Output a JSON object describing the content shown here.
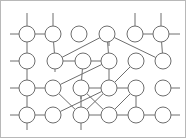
{
  "figure": {
    "type": "node-link-diagram",
    "width": 186,
    "height": 138,
    "background_color": "#ffffff",
    "stroke_color": "#6e6e6e",
    "node_fill_color": "#ffffff",
    "border_color": "#b8b8b8",
    "node_radius": 8,
    "node_count": 24,
    "grid_rows": 4,
    "grid_columns": 6
  },
  "nodes": [
    {
      "id": "n00",
      "row": 0,
      "col": 0,
      "cx": 27,
      "cy": 34
    },
    {
      "id": "n01",
      "row": 0,
      "col": 1,
      "cx": 53,
      "cy": 34
    },
    {
      "id": "n02",
      "row": 0,
      "col": 2,
      "cx": 79,
      "cy": 34
    },
    {
      "id": "n03",
      "row": 0,
      "col": 3,
      "cx": 107,
      "cy": 34
    },
    {
      "id": "n04",
      "row": 0,
      "col": 4,
      "cx": 135,
      "cy": 34
    },
    {
      "id": "n05",
      "row": 0,
      "col": 5,
      "cx": 161,
      "cy": 34
    },
    {
      "id": "n10",
      "row": 1,
      "col": 0,
      "cx": 27,
      "cy": 61
    },
    {
      "id": "n11",
      "row": 1,
      "col": 1,
      "cx": 55,
      "cy": 61
    },
    {
      "id": "n12",
      "row": 1,
      "col": 2,
      "cx": 83,
      "cy": 61
    },
    {
      "id": "n13",
      "row": 1,
      "col": 3,
      "cx": 109,
      "cy": 61
    },
    {
      "id": "n14",
      "row": 1,
      "col": 4,
      "cx": 136,
      "cy": 61
    },
    {
      "id": "n15",
      "row": 1,
      "col": 5,
      "cx": 163,
      "cy": 61
    },
    {
      "id": "n20",
      "row": 2,
      "col": 0,
      "cx": 27,
      "cy": 88
    },
    {
      "id": "n21",
      "row": 2,
      "col": 1,
      "cx": 53,
      "cy": 88
    },
    {
      "id": "n22",
      "row": 2,
      "col": 2,
      "cx": 81,
      "cy": 88
    },
    {
      "id": "n23",
      "row": 2,
      "col": 3,
      "cx": 109,
      "cy": 88
    },
    {
      "id": "n24",
      "row": 2,
      "col": 4,
      "cx": 136,
      "cy": 88
    },
    {
      "id": "n25",
      "row": 2,
      "col": 5,
      "cx": 163,
      "cy": 88
    },
    {
      "id": "n30",
      "row": 3,
      "col": 0,
      "cx": 27,
      "cy": 115
    },
    {
      "id": "n31",
      "row": 3,
      "col": 1,
      "cx": 53,
      "cy": 115
    },
    {
      "id": "n32",
      "row": 3,
      "col": 2,
      "cx": 81,
      "cy": 115
    },
    {
      "id": "n33",
      "row": 3,
      "col": 3,
      "cx": 109,
      "cy": 115
    },
    {
      "id": "n34",
      "row": 3,
      "col": 4,
      "cx": 136,
      "cy": 115
    },
    {
      "id": "n35",
      "row": 3,
      "col": 5,
      "cx": 163,
      "cy": 115
    }
  ],
  "edges": [
    {
      "from": "n00",
      "to": "n01",
      "kind": "horizontal"
    },
    {
      "from": "n04",
      "to": "n05",
      "kind": "horizontal"
    },
    {
      "from": "n11",
      "to": "n12",
      "kind": "horizontal"
    },
    {
      "from": "n12",
      "to": "n13",
      "kind": "horizontal"
    },
    {
      "from": "n20",
      "to": "n21",
      "kind": "horizontal"
    },
    {
      "from": "n22",
      "to": "n23",
      "kind": "horizontal"
    },
    {
      "from": "n23",
      "to": "n24",
      "kind": "horizontal"
    },
    {
      "from": "n30",
      "to": "n31",
      "kind": "horizontal"
    },
    {
      "from": "n32",
      "to": "n33",
      "kind": "horizontal"
    },
    {
      "from": "n33",
      "to": "n34",
      "kind": "horizontal"
    },
    {
      "from": "n34",
      "to": "n35",
      "kind": "horizontal"
    },
    {
      "from": "n00",
      "to": "n10",
      "kind": "vertical"
    },
    {
      "from": "n01",
      "to": "n11",
      "kind": "vertical"
    },
    {
      "from": "n03",
      "to": "n13",
      "kind": "vertical"
    },
    {
      "from": "n05",
      "to": "n15",
      "kind": "vertical"
    },
    {
      "from": "n10",
      "to": "n20",
      "kind": "vertical"
    },
    {
      "from": "n13",
      "to": "n23",
      "kind": "vertical"
    },
    {
      "from": "n20",
      "to": "n30",
      "kind": "vertical"
    },
    {
      "from": "n24",
      "to": "n34",
      "kind": "vertical"
    },
    {
      "from": "n22",
      "to": "n32",
      "kind": "vertical"
    },
    {
      "from": "n03",
      "to": "n11",
      "kind": "diagonal"
    },
    {
      "from": "n03",
      "to": "n15",
      "kind": "diagonal"
    },
    {
      "from": "n13",
      "to": "n21",
      "kind": "diagonal"
    },
    {
      "from": "n12",
      "to": "n22",
      "kind": "diagonal"
    },
    {
      "from": "n23",
      "to": "n32",
      "kind": "diagonal"
    },
    {
      "from": "n24",
      "to": "n33",
      "kind": "diagonal"
    },
    {
      "from": "n22",
      "to": "n33",
      "kind": "diagonal"
    },
    {
      "from": "n23",
      "to": "n31",
      "kind": "diagonal"
    },
    {
      "from": "n21",
      "to": "n32",
      "kind": "diagonal"
    },
    {
      "from": "n14",
      "to": "n23",
      "kind": "diagonal"
    }
  ],
  "stubs": [
    {
      "id": "stub-top-c0",
      "x1": 27,
      "y1": 34,
      "x2": 27,
      "y2": 13
    },
    {
      "id": "stub-top-c1",
      "x1": 53,
      "y1": 34,
      "x2": 53,
      "y2": 13
    },
    {
      "id": "stub-top-c4",
      "x1": 135,
      "y1": 34,
      "x2": 135,
      "y2": 13
    },
    {
      "id": "stub-top-c5",
      "x1": 161,
      "y1": 34,
      "x2": 161,
      "y2": 13
    },
    {
      "id": "stub-left-r0",
      "x1": 27,
      "y1": 34,
      "x2": 10,
      "y2": 34
    },
    {
      "id": "stub-left-r1",
      "x1": 27,
      "y1": 61,
      "x2": 10,
      "y2": 61
    },
    {
      "id": "stub-left-r2",
      "x1": 27,
      "y1": 88,
      "x2": 10,
      "y2": 88
    },
    {
      "id": "stub-left-r3",
      "x1": 27,
      "y1": 115,
      "x2": 10,
      "y2": 115
    },
    {
      "id": "stub-right-r0",
      "x1": 161,
      "y1": 34,
      "x2": 180,
      "y2": 34
    },
    {
      "id": "stub-right-r2",
      "x1": 163,
      "y1": 88,
      "x2": 180,
      "y2": 88
    },
    {
      "id": "stub-right-r3",
      "x1": 163,
      "y1": 115,
      "x2": 180,
      "y2": 115
    },
    {
      "id": "stub-bottom-c0",
      "x1": 27,
      "y1": 115,
      "x2": 27,
      "y2": 130
    },
    {
      "id": "stub-bottom-c2",
      "x1": 81,
      "y1": 115,
      "x2": 81,
      "y2": 130
    },
    {
      "id": "stub-bottom-c3",
      "x1": 109,
      "y1": 34,
      "x2": 109,
      "y2": 46
    },
    {
      "id": "stub-down-n22",
      "x1": 81,
      "y1": 88,
      "x2": 81,
      "y2": 99
    },
    {
      "id": "stub-down-n11",
      "x1": 55,
      "y1": 61,
      "x2": 55,
      "y2": 72
    }
  ]
}
